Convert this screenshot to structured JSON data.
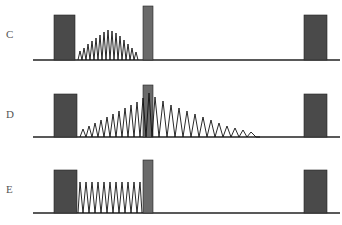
{
  "figure": {
    "panels": [
      {
        "label": "C",
        "description": "Two wide pulses with short narrow pulse; oscillation rises and falls between first wide pulse and narrow pulse"
      },
      {
        "label": "D",
        "description": "Oscillation grows up to narrow pulse then decays after it"
      },
      {
        "label": "E",
        "description": "Constant-amplitude oscillation between first wide pulse and narrow pulse"
      }
    ],
    "caption": "",
    "colors": {
      "block": "#4a4a4a",
      "narrow_block": "#6a6a6a",
      "line": "#111111",
      "label": "#555555"
    }
  }
}
